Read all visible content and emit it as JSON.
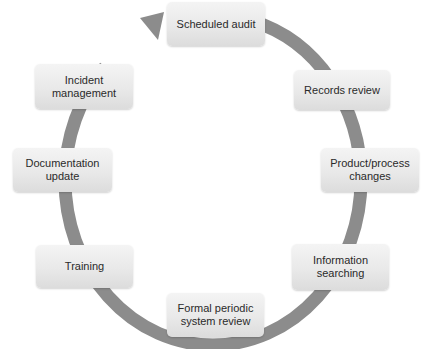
{
  "diagram": {
    "type": "cycle",
    "ring_color": "#8c8c8c",
    "box_color": "#e6e6e6",
    "steps": [
      {
        "label": "Scheduled audit"
      },
      {
        "label": "Records review"
      },
      {
        "label": "Product/process changes"
      },
      {
        "label": "Information searching"
      },
      {
        "label": "Formal periodic system review"
      },
      {
        "label": "Training"
      },
      {
        "label": "Documentation update"
      },
      {
        "label": "Incident management"
      }
    ],
    "arrow": "arrow-into-scheduled-audit"
  }
}
